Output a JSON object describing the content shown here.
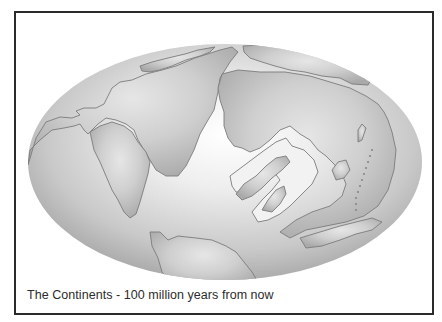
{
  "figure": {
    "caption": "The Continents - 100 million years from now",
    "projection": "elliptical (Mollweide-style) world projection",
    "colors": {
      "frame_border": "#2a2a2a",
      "background": "#ffffff",
      "ocean_highlight": "#fbfbfb",
      "ocean_edge": "#9a9a9a",
      "land_fill": "#c4c4c4",
      "coastline": "#7a7a7a"
    },
    "landmasses": [
      {
        "name": "north-atlantic-northern-landmass"
      },
      {
        "name": "americas-western-landmass"
      },
      {
        "name": "africa-eurasia-central-landmass"
      },
      {
        "name": "asian-arc-islands"
      },
      {
        "name": "southern-landmass"
      }
    ]
  }
}
